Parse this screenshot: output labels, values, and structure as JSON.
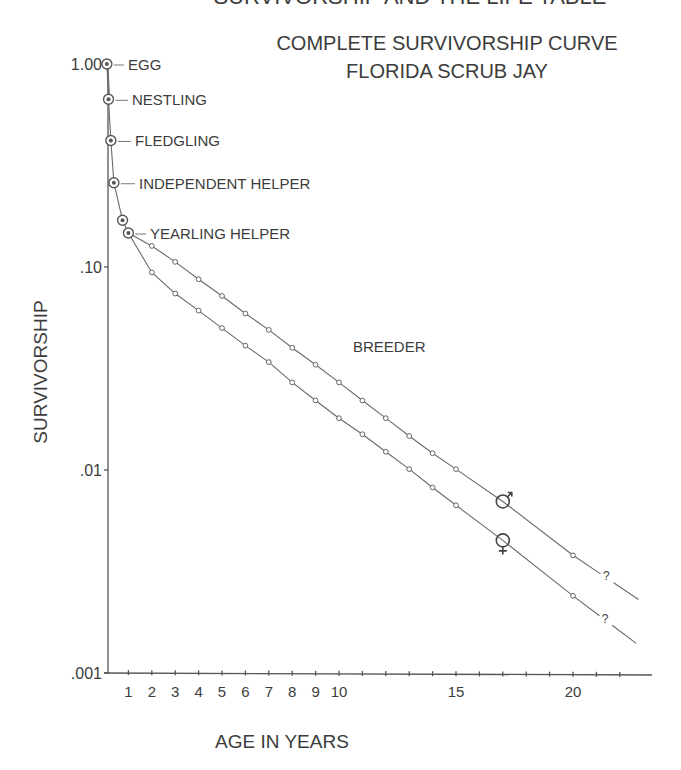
{
  "header": {
    "clipped_heading": "SURVIVORSHIP AND THE LIFE TABLE"
  },
  "chart_data": {
    "type": "line",
    "title": "COMPLETE SURVIVORSHIP CURVE",
    "subtitle": "FLORIDA SCRUB JAY",
    "xlabel": "AGE IN YEARS",
    "ylabel": "SURVIVORSHIP",
    "yscale": "log",
    "ylim": [
      0.001,
      1.0
    ],
    "xlim": [
      0,
      23
    ],
    "grid": false,
    "legend_position": "inline",
    "y_ticks": [
      {
        "value": 1.0,
        "label": "1.00"
      },
      {
        "value": 0.1,
        "label": ".10"
      },
      {
        "value": 0.01,
        "label": ".01"
      },
      {
        "value": 0.001,
        "label": ".001"
      }
    ],
    "x_ticks": [
      {
        "value": 1,
        "label": "1"
      },
      {
        "value": 2,
        "label": "2"
      },
      {
        "value": 3,
        "label": "3"
      },
      {
        "value": 4,
        "label": "4"
      },
      {
        "value": 5,
        "label": "5"
      },
      {
        "value": 6,
        "label": "6"
      },
      {
        "value": 7,
        "label": "7"
      },
      {
        "value": 8,
        "label": "8"
      },
      {
        "value": 9,
        "label": "9"
      },
      {
        "value": 10,
        "label": "10"
      },
      {
        "value": 11,
        "label": ""
      },
      {
        "value": 12,
        "label": ""
      },
      {
        "value": 13,
        "label": ""
      },
      {
        "value": 14,
        "label": ""
      },
      {
        "value": 15,
        "label": "15"
      },
      {
        "value": 16,
        "label": ""
      },
      {
        "value": 17,
        "label": ""
      },
      {
        "value": 18,
        "label": ""
      },
      {
        "value": 19,
        "label": ""
      },
      {
        "value": 20,
        "label": "20"
      },
      {
        "value": 21,
        "label": ""
      },
      {
        "value": 22,
        "label": ""
      }
    ],
    "juvenile_stages": [
      {
        "label": "EGG",
        "age": 0.08,
        "value": 1.0,
        "labelled": true
      },
      {
        "label": "NESTLING",
        "age": 0.15,
        "value": 0.67,
        "labelled": true
      },
      {
        "label": "FLEDGLING",
        "age": 0.25,
        "value": 0.42,
        "labelled": true
      },
      {
        "label": "INDEPENDENT HELPER",
        "age": 0.38,
        "value": 0.26,
        "labelled": true
      },
      {
        "label": "",
        "age": 0.75,
        "value": 0.17,
        "labelled": false
      },
      {
        "label": "YEARLING HELPER",
        "age": 1.0,
        "value": 0.147,
        "labelled": true
      }
    ],
    "stage_label_breeder": "BREEDER",
    "series": [
      {
        "name": "Male",
        "symbol": "♂",
        "x": [
          2,
          3,
          4,
          5,
          6,
          7,
          8,
          9,
          10,
          11,
          12,
          13,
          14,
          15,
          20
        ],
        "values": [
          0.127,
          0.106,
          0.087,
          0.072,
          0.059,
          0.049,
          0.04,
          0.033,
          0.027,
          0.022,
          0.018,
          0.0147,
          0.0121,
          0.0101,
          0.0038
        ],
        "symbol_at": {
          "age": 17,
          "value": 0.007
        },
        "extrapolated_to": {
          "age": 22.8,
          "value": 0.0023
        },
        "uncertain_marker": "?"
      },
      {
        "name": "Female",
        "symbol": "♀",
        "x": [
          2,
          3,
          4,
          5,
          6,
          7,
          8,
          9,
          10,
          11,
          12,
          13,
          14,
          15,
          20
        ],
        "values": [
          0.094,
          0.074,
          0.061,
          0.05,
          0.041,
          0.034,
          0.027,
          0.022,
          0.018,
          0.015,
          0.0123,
          0.0101,
          0.0082,
          0.0067,
          0.0024
        ],
        "symbol_at": {
          "age": 17,
          "value": 0.0045
        },
        "extrapolated_to": {
          "age": 22.7,
          "value": 0.0014
        },
        "uncertain_marker": "?"
      }
    ]
  },
  "style": {
    "ink": "#3c3c3c",
    "line": "#6a6a6a",
    "background": "#ffffff"
  }
}
